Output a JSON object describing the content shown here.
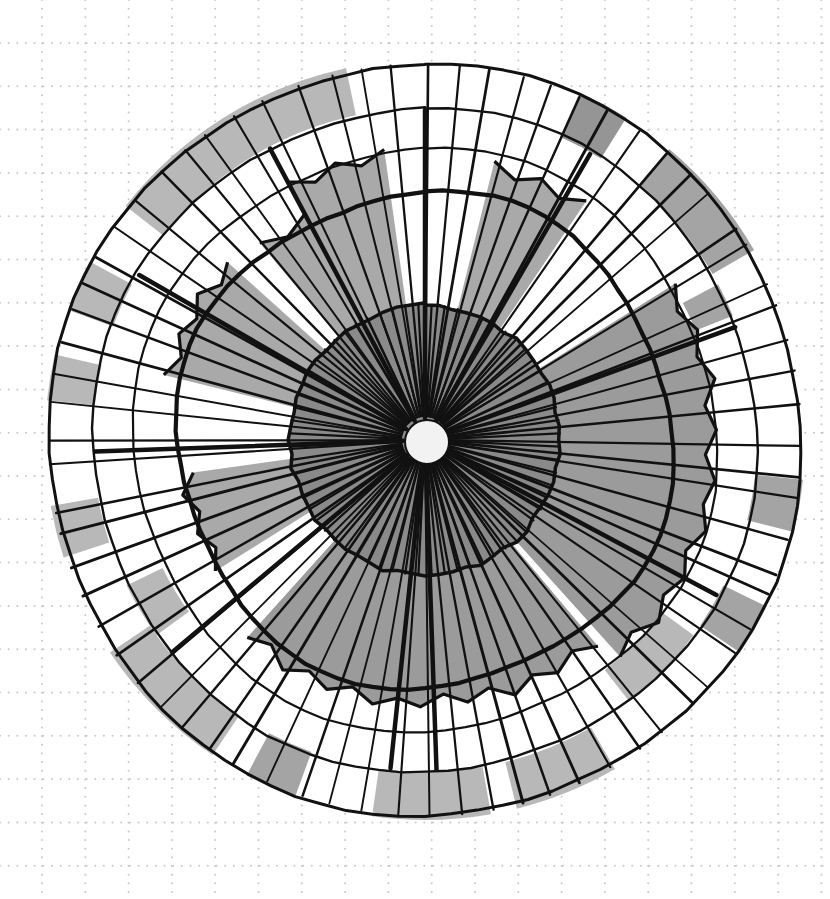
{
  "paper": {
    "background": "#ffffff",
    "dot_color": "#c8c8c8",
    "grid_spacing_px": 43.3,
    "grid_origin": [
      42,
      43
    ]
  },
  "colors": {
    "ink": "#111111",
    "fill_dark": "#8a8a8a",
    "fill_mid": "#9a9a9a",
    "fill_light": "#b0b0b0",
    "hub": "#f2f2f2"
  },
  "diagram": {
    "center": [
      425,
      440
    ],
    "hub_radius": 22,
    "inner_disc_radius": 135,
    "band_base_radius": 180,
    "bold_ring_radius": 292,
    "mid_ring_radius": 332,
    "outer_ring_radius": 376,
    "sector_count": 72,
    "spoke_angles_deg_note": "clockwise from 12 o'clock",
    "band_extents": [
      {
        "from": -40,
        "to": -28,
        "r": 250,
        "shade": "fill_mid"
      },
      {
        "from": -28,
        "to": -8,
        "r": 285,
        "shade": "fill_mid"
      },
      {
        "from": 14,
        "to": 34,
        "r": 280,
        "shade": "fill_mid"
      },
      {
        "from": 58,
        "to": 138,
        "r": 288,
        "shade": "fill_dark"
      },
      {
        "from": 140,
        "to": 222,
        "r": 262,
        "shade": "fill_dark"
      },
      {
        "from": 238,
        "to": 262,
        "r": 240,
        "shade": "fill_mid"
      },
      {
        "from": 284,
        "to": 312,
        "r": 262,
        "shade": "fill_mid"
      }
    ],
    "band_edge_jitter": [
      12,
      -8,
      10,
      -6,
      14,
      -10,
      6,
      -12,
      8,
      -4
    ],
    "outer_cells": [
      {
        "from": -52,
        "to": -12,
        "ring": "outer",
        "shade": "fill_light"
      },
      {
        "from": 24,
        "to": 32,
        "ring": "outer",
        "shade": "fill_dark"
      },
      {
        "from": 40,
        "to": 60,
        "ring": "outer",
        "shade": "fill_mid"
      },
      {
        "from": 62,
        "to": 68,
        "ring": "mid",
        "shade": "fill_mid"
      },
      {
        "from": 96,
        "to": 104,
        "ring": "outer",
        "shade": "fill_mid"
      },
      {
        "from": 116,
        "to": 124,
        "ring": "outer",
        "shade": "fill_mid"
      },
      {
        "from": 126,
        "to": 142,
        "ring": "mid",
        "shade": "fill_light"
      },
      {
        "from": 150,
        "to": 166,
        "ring": "outer",
        "shade": "fill_light"
      },
      {
        "from": 170,
        "to": 188,
        "ring": "outer",
        "shade": "fill_light"
      },
      {
        "from": 200,
        "to": 208,
        "ring": "outer",
        "shade": "fill_mid"
      },
      {
        "from": 214,
        "to": 236,
        "ring": "outer",
        "shade": "fill_light"
      },
      {
        "from": 234,
        "to": 244,
        "ring": "mid",
        "shade": "fill_light"
      },
      {
        "from": 252,
        "to": 260,
        "ring": "outer",
        "shade": "fill_light"
      },
      {
        "from": 276,
        "to": 283,
        "ring": "outer",
        "shade": "fill_light"
      },
      {
        "from": 290,
        "to": 298,
        "ring": "outer",
        "shade": "fill_light"
      }
    ],
    "bold_spokes_deg": [
      -28,
      0,
      30,
      70,
      118,
      178,
      186,
      230,
      268,
      300
    ],
    "dense_spokes_inner": 64
  }
}
